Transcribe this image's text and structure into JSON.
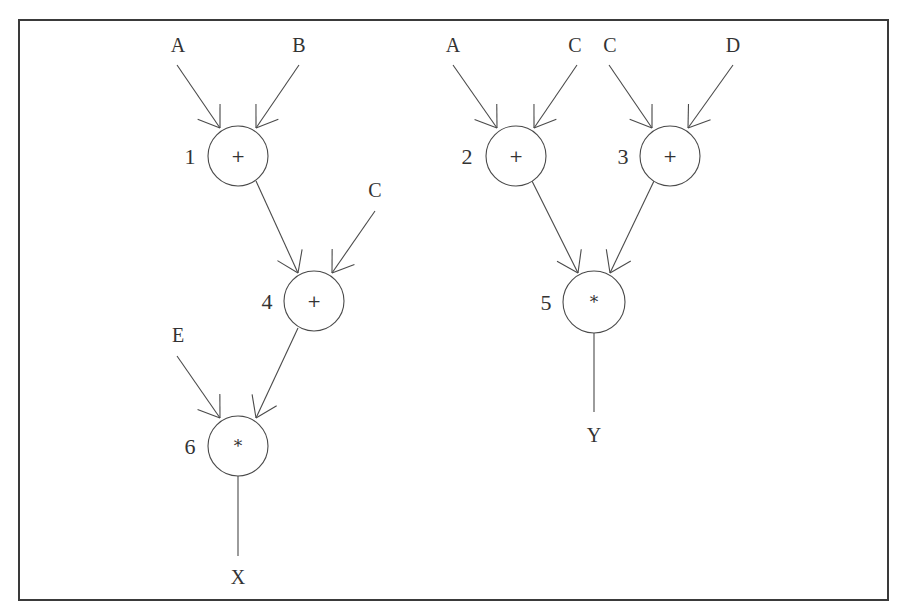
{
  "diagram": {
    "type": "dataflow-graph",
    "frame": {
      "x": 19,
      "y": 20,
      "width": 869,
      "height": 580
    },
    "colors": {
      "stroke": "#4a4a4a",
      "text": "#333333",
      "background": "#ffffff"
    },
    "nodes": [
      {
        "id": "1",
        "op": "+",
        "cx": 238,
        "cy": 156,
        "r": 30,
        "label_x": 190,
        "label_y": 164
      },
      {
        "id": "2",
        "op": "+",
        "cx": 516,
        "cy": 156,
        "r": 30,
        "label_x": 467,
        "label_y": 164
      },
      {
        "id": "3",
        "op": "+",
        "cx": 670,
        "cy": 156,
        "r": 30,
        "label_x": 623,
        "label_y": 164
      },
      {
        "id": "4",
        "op": "+",
        "cx": 314,
        "cy": 301,
        "r": 30,
        "label_x": 267,
        "label_y": 309
      },
      {
        "id": "5",
        "op": "*",
        "cx": 594,
        "cy": 302,
        "r": 31,
        "label_x": 546,
        "label_y": 310
      },
      {
        "id": "6",
        "op": "*",
        "cx": 238,
        "cy": 446,
        "r": 30,
        "label_x": 190,
        "label_y": 454
      }
    ],
    "inputs": [
      {
        "name": "A",
        "x": 178,
        "y": 52
      },
      {
        "name": "B",
        "x": 299,
        "y": 52
      },
      {
        "name": "C",
        "x": 375,
        "y": 197
      },
      {
        "name": "E",
        "x": 178,
        "y": 342
      },
      {
        "name": "A",
        "x": 453,
        "y": 52
      },
      {
        "name": "C",
        "x": 575,
        "y": 52
      },
      {
        "name": "C",
        "x": 610,
        "y": 52
      },
      {
        "name": "D",
        "x": 733,
        "y": 52
      }
    ],
    "outputs": [
      {
        "name": "X",
        "x": 238,
        "y": 584
      },
      {
        "name": "Y",
        "x": 594,
        "y": 442
      }
    ],
    "edges": [
      {
        "from": "A",
        "to": "1",
        "x1": 177,
        "y1": 65,
        "x2": 220,
        "y2": 128
      },
      {
        "from": "B",
        "to": "1",
        "x1": 299,
        "y1": 65,
        "x2": 256,
        "y2": 128
      },
      {
        "from": "1",
        "to": "4",
        "x1": 256,
        "y1": 181,
        "x2": 298,
        "y2": 273
      },
      {
        "from": "C",
        "to": "4",
        "x1": 375,
        "y1": 211,
        "x2": 332,
        "y2": 273
      },
      {
        "from": "4",
        "to": "6",
        "x1": 298,
        "y1": 328,
        "x2": 256,
        "y2": 418
      },
      {
        "from": "E",
        "to": "6",
        "x1": 177,
        "y1": 356,
        "x2": 220,
        "y2": 418
      },
      {
        "from": "A",
        "to": "2",
        "x1": 453,
        "y1": 65,
        "x2": 497,
        "y2": 128
      },
      {
        "from": "C",
        "to": "2",
        "x1": 577,
        "y1": 65,
        "x2": 534,
        "y2": 128
      },
      {
        "from": "C",
        "to": "3",
        "x1": 609,
        "y1": 65,
        "x2": 652,
        "y2": 128
      },
      {
        "from": "D",
        "to": "3",
        "x1": 733,
        "y1": 65,
        "x2": 688,
        "y2": 128
      },
      {
        "from": "2",
        "to": "5",
        "x1": 532,
        "y1": 181,
        "x2": 578,
        "y2": 273
      },
      {
        "from": "3",
        "to": "5",
        "x1": 654,
        "y1": 181,
        "x2": 610,
        "y2": 273
      }
    ],
    "output_lines": [
      {
        "from": "6",
        "to": "X",
        "x1": 238,
        "y1": 476,
        "x2": 238,
        "y2": 556
      },
      {
        "from": "5",
        "to": "Y",
        "x1": 594,
        "y1": 333,
        "x2": 594,
        "y2": 412
      }
    ]
  }
}
